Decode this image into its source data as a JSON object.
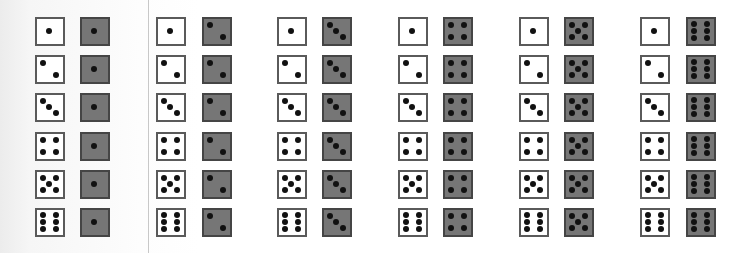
{
  "diagram": {
    "colors": {
      "white_die_fill": "#ffffff",
      "white_die_border": "#5a5a5a",
      "dark_die_fill": "#767676",
      "dark_die_border": "#454545",
      "pip": "#111111",
      "divider": "#c8c8c8"
    },
    "groups": [
      {
        "dark_value": 1,
        "white_x": 35,
        "dark_x": 80
      },
      {
        "dark_value": 2,
        "white_x": 156,
        "dark_x": 202
      },
      {
        "dark_value": 3,
        "white_x": 277,
        "dark_x": 322
      },
      {
        "dark_value": 4,
        "white_x": 398,
        "dark_x": 443
      },
      {
        "dark_value": 5,
        "white_x": 519,
        "dark_x": 564
      },
      {
        "dark_value": 6,
        "white_x": 640,
        "dark_x": 686
      }
    ],
    "rows": [
      {
        "white_value": 1,
        "y": 17
      },
      {
        "white_value": 2,
        "y": 55
      },
      {
        "white_value": 3,
        "y": 93
      },
      {
        "white_value": 4,
        "y": 132
      },
      {
        "white_value": 5,
        "y": 170
      },
      {
        "white_value": 6,
        "y": 208
      }
    ]
  }
}
